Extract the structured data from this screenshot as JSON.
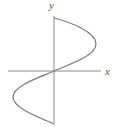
{
  "figure": {
    "x_label": "x",
    "y_label": "y",
    "axis_color": "#8a8a8a",
    "curve_color": "#7a7a7a"
  }
}
